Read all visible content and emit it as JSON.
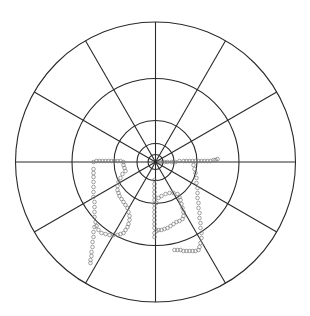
{
  "chart_data": {
    "type": "scatter",
    "subtype": "polar",
    "title": "",
    "xlabel": "",
    "ylabel": "",
    "legend": [],
    "grid": true,
    "center_px": [
      155.5,
      162
    ],
    "ring_radii_px": [
      140,
      83.5,
      41.5,
      18.5,
      7.5
    ],
    "spoke_angles_deg": [
      0,
      30,
      60,
      90,
      120,
      150,
      180,
      210,
      240,
      270,
      300,
      330
    ],
    "point_style": {
      "shape": "open-circle",
      "radius_px": 1.8,
      "color": "#7a7a7a"
    },
    "line_color": "#2a2a2a",
    "background": "#ffffff",
    "series": [
      {
        "name": "left-outer-curve",
        "points_px": [
          [
            -62,
            0
          ],
          [
            -59,
            -1
          ],
          [
            -56,
            -1
          ],
          [
            -53,
            -1
          ],
          [
            -50,
            -1
          ],
          [
            -47,
            -1
          ],
          [
            -44,
            -1
          ],
          [
            -41,
            -1
          ],
          [
            -38,
            -1
          ],
          [
            -35,
            -1
          ],
          [
            -32,
            0
          ],
          [
            -32,
            3
          ],
          [
            -31,
            6
          ],
          [
            -30,
            9
          ],
          [
            -62,
            7
          ],
          [
            -62,
            11
          ],
          [
            -62,
            15
          ],
          [
            -62,
            20
          ],
          [
            -62,
            25
          ],
          [
            -62,
            30
          ],
          [
            -62,
            35
          ],
          [
            -61,
            40
          ],
          [
            -61,
            45
          ],
          [
            -61,
            50
          ],
          [
            -61,
            55
          ],
          [
            -60,
            60
          ],
          [
            -59,
            64
          ],
          [
            -57,
            68
          ],
          [
            -54,
            71
          ],
          [
            -50,
            72
          ],
          [
            -46,
            73
          ],
          [
            -42,
            73
          ],
          [
            -38,
            73
          ],
          [
            -35,
            72
          ],
          [
            -32,
            71
          ],
          [
            -30,
            68
          ],
          [
            -61,
            65
          ],
          [
            -62,
            70
          ],
          [
            -62,
            75
          ],
          [
            -63,
            80
          ],
          [
            -63,
            85
          ],
          [
            -64,
            90
          ],
          [
            -64,
            94
          ],
          [
            -65,
            98
          ],
          [
            -65,
            101
          ]
        ]
      },
      {
        "name": "left-inner-curve",
        "points_px": [
          [
            -33,
            12
          ],
          [
            -35,
            16
          ],
          [
            -37,
            20
          ],
          [
            -38,
            24
          ],
          [
            -38,
            28
          ],
          [
            -37,
            31
          ],
          [
            -36,
            34
          ],
          [
            -34,
            37
          ],
          [
            -32,
            40
          ],
          [
            -30,
            43
          ],
          [
            -28,
            46
          ],
          [
            -27,
            50
          ],
          [
            -26,
            54
          ],
          [
            -26,
            58
          ],
          [
            -27,
            62
          ],
          [
            -28,
            65
          ]
        ]
      },
      {
        "name": "bottom-center-curve",
        "points_px": [
          [
            -1,
            18
          ],
          [
            -1,
            22
          ],
          [
            -1,
            26
          ],
          [
            -1,
            30
          ],
          [
            -1,
            34
          ],
          [
            -1,
            38
          ],
          [
            -1,
            42
          ],
          [
            -1,
            46
          ],
          [
            -1,
            50
          ],
          [
            -1,
            54
          ],
          [
            -1,
            58
          ],
          [
            -1,
            62
          ],
          [
            -1,
            66
          ],
          [
            -1,
            71
          ],
          [
            -1,
            75
          ],
          [
            1,
            41
          ],
          [
            3,
            36
          ],
          [
            6,
            34
          ],
          [
            10,
            32
          ],
          [
            14,
            31
          ],
          [
            18,
            31
          ],
          [
            22,
            32
          ],
          [
            24,
            35
          ],
          [
            25,
            38
          ],
          [
            26,
            42
          ],
          [
            27,
            46
          ],
          [
            28,
            50
          ],
          [
            28,
            54
          ],
          [
            27,
            57
          ],
          [
            24,
            59
          ],
          [
            21,
            60
          ],
          [
            18,
            62
          ],
          [
            15,
            64
          ],
          [
            12,
            66
          ],
          [
            9,
            67
          ],
          [
            6,
            68
          ],
          [
            3,
            68
          ],
          [
            1,
            69
          ]
        ]
      },
      {
        "name": "right-curve",
        "points_px": [
          [
            12,
            0
          ],
          [
            16,
            0
          ],
          [
            20,
            0
          ],
          [
            24,
            -1
          ],
          [
            28,
            -1
          ],
          [
            31,
            -1
          ],
          [
            34,
            -1
          ],
          [
            37,
            -1
          ],
          [
            40,
            -1
          ],
          [
            43,
            -1
          ],
          [
            46,
            -1
          ],
          [
            49,
            -1
          ],
          [
            52,
            -1
          ],
          [
            55,
            -1
          ],
          [
            58,
            -2
          ],
          [
            60,
            -2
          ],
          [
            62,
            -3
          ],
          [
            5,
            0
          ],
          [
            9,
            0
          ],
          [
            38,
            3
          ],
          [
            39,
            7
          ],
          [
            40,
            11
          ],
          [
            41,
            16
          ],
          [
            41,
            21
          ],
          [
            42,
            26
          ],
          [
            42,
            31
          ],
          [
            42,
            36
          ],
          [
            43,
            41
          ],
          [
            43,
            46
          ],
          [
            44,
            51
          ],
          [
            44,
            56
          ],
          [
            45,
            61
          ],
          [
            45,
            66
          ],
          [
            46,
            71
          ],
          [
            46,
            76
          ],
          [
            45,
            81
          ],
          [
            44,
            85
          ],
          [
            43,
            88
          ],
          [
            40,
            89
          ],
          [
            37,
            89
          ],
          [
            34,
            89
          ],
          [
            31,
            89
          ],
          [
            28,
            89
          ],
          [
            25,
            88
          ],
          [
            22,
            88
          ],
          [
            19,
            88
          ]
        ]
      }
    ]
  }
}
